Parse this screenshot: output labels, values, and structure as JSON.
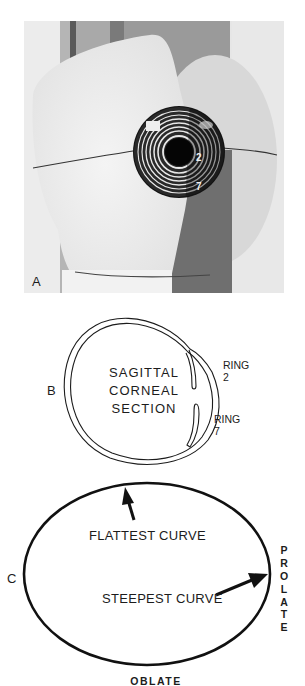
{
  "panels": {
    "a": {
      "label": "A",
      "ring_labels": [
        "2",
        "7"
      ]
    },
    "b": {
      "label": "B",
      "title_lines": [
        "SAGITTAL",
        "CORNEAL",
        "SECTION"
      ],
      "ring2_lines": [
        "RING",
        "2"
      ],
      "ring7_lines": [
        "RING",
        "7"
      ]
    },
    "c": {
      "label": "C",
      "flattest": "FLATTEST CURVE",
      "steepest": "STEEPEST CURVE",
      "bottom": "OBLATE",
      "side_letters": [
        "P",
        "R",
        "O",
        "L",
        "A",
        "T",
        "E"
      ]
    }
  },
  "colors": {
    "ink": "#1c1c1c",
    "photo_bg": "#e4e4e4",
    "gray_band": "#8a8a8a",
    "cornea": "#111111"
  }
}
